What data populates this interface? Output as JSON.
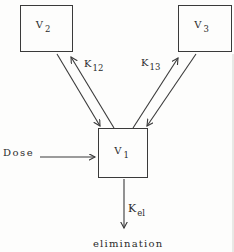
{
  "diagram": {
    "compartments": {
      "v2": {
        "base": "V",
        "sub": "2"
      },
      "v3": {
        "base": "V",
        "sub": "3"
      },
      "v1": {
        "base": "V",
        "sub": "1"
      }
    },
    "rate_constants": {
      "k12": {
        "base": "K",
        "sub": "12"
      },
      "k13": {
        "base": "K",
        "sub": "13"
      },
      "kel": {
        "base": "K",
        "sub": "el"
      }
    },
    "labels": {
      "dose": "Dose",
      "elimination": "elimination"
    },
    "arrows": [
      {
        "name": "v2-to-v1",
        "from": "v2",
        "to": "v1"
      },
      {
        "name": "v1-to-v2",
        "from": "v1",
        "to": "v2"
      },
      {
        "name": "v1-to-v3",
        "from": "v1",
        "to": "v3"
      },
      {
        "name": "v3-to-v1",
        "from": "v3",
        "to": "v1"
      },
      {
        "name": "dose-into-v1",
        "from": "dose",
        "to": "v1"
      },
      {
        "name": "v1-to-elimination",
        "from": "v1",
        "to": "elimination"
      }
    ]
  },
  "colors": {
    "line": "#3a3a3a",
    "text": "#2b2b2b",
    "background": "#fdfdfc"
  }
}
